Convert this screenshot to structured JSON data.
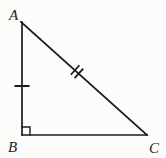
{
  "figure": {
    "type": "right-triangle",
    "labels": {
      "vertex_a": "A",
      "vertex_b": "B",
      "vertex_c": "C"
    },
    "right_angle_vertex": "B",
    "tick_marks": [
      {
        "side": "AB",
        "count": 1
      },
      {
        "side": "AC",
        "count": 2
      }
    ],
    "colors": {
      "stroke": "#1c1c1c",
      "background": "#fcfcfb"
    }
  }
}
